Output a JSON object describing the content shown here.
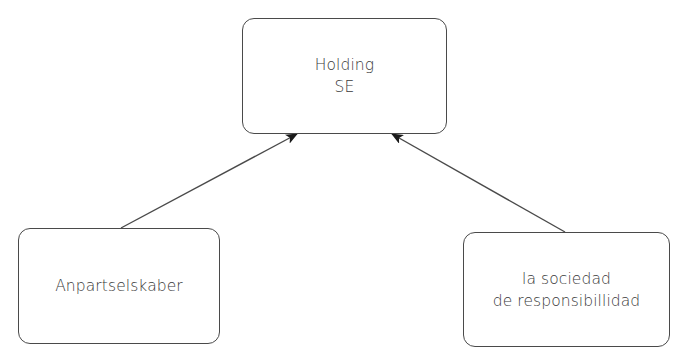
{
  "diagram": {
    "type": "hierarchy",
    "nodes": [
      {
        "id": "holding",
        "lines": [
          "Holding",
          "SE"
        ]
      },
      {
        "id": "anpartselskaber",
        "lines": [
          "Anpartselskaber"
        ]
      },
      {
        "id": "sociedad",
        "lines": [
          "la sociedad",
          "de responsibillidad"
        ]
      }
    ],
    "edges": [
      {
        "from": "anpartselskaber",
        "to": "holding",
        "style": "arrow"
      },
      {
        "from": "sociedad",
        "to": "holding",
        "style": "arrow"
      }
    ],
    "colors": {
      "stroke": "#4a4a4a",
      "text": "#3a3a3a",
      "background": "#ffffff"
    }
  }
}
